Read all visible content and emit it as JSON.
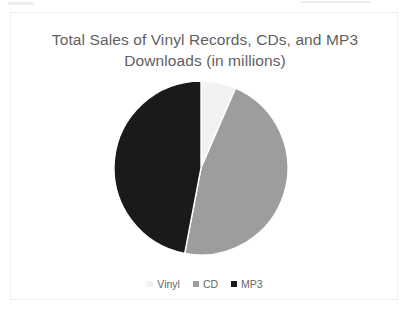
{
  "chart_data": {
    "type": "pie",
    "title": "Total Sales of Vinyl Records, CDs, and MP3 Downloads (in millions)",
    "title_line1": "Total Sales of Vinyl Records, CDs, and MP3",
    "title_line2": "Downloads (in millions)",
    "xlabel": "",
    "ylabel": "",
    "categories": [
      "Vinyl",
      "CD",
      "MP3"
    ],
    "values": [
      6.5,
      46.5,
      47.0
    ],
    "units": "millions",
    "start_angle_deg": 0,
    "direction": "clockwise",
    "legend_position": "bottom",
    "grid": false,
    "data_labels": false,
    "slices": [
      {
        "label": "Vinyl",
        "value": 6.5,
        "percent": 6.5,
        "color": "#f2f2f2",
        "start_angle_deg": 0,
        "end_angle_deg": 23.4
      },
      {
        "label": "CD",
        "value": 46.5,
        "percent": 46.5,
        "color": "#9d9d9d",
        "start_angle_deg": 23.4,
        "end_angle_deg": 190.8
      },
      {
        "label": "MP3",
        "value": 47.0,
        "percent": 47.0,
        "color": "#1a1a1a",
        "start_angle_deg": 190.8,
        "end_angle_deg": 360
      }
    ]
  },
  "legend": {
    "items": [
      {
        "label": "Vinyl",
        "color": "#f2f2f2"
      },
      {
        "label": "CD",
        "color": "#9d9d9d"
      },
      {
        "label": "MP3",
        "color": "#1a1a1a"
      }
    ]
  },
  "colors": {
    "background": "#ffffff",
    "card_border": "#f0f0f0",
    "title_text": "#5f5f5f",
    "legend_text": "#676767",
    "vinyl": "#f2f2f2",
    "cd": "#9d9d9d",
    "mp3": "#1a1a1a"
  }
}
